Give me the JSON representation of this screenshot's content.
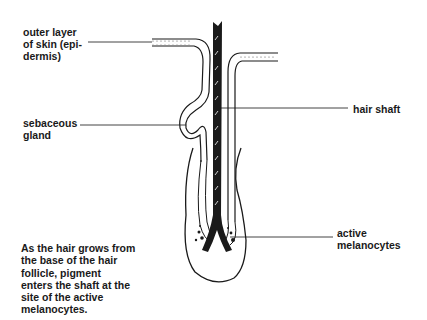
{
  "diagram": {
    "labels": {
      "epidermis": [
        "outer layer",
        "of skin (epi-",
        "dermis)"
      ],
      "sebaceous_gland": [
        "sebaceous",
        "gland"
      ],
      "hair_shaft": [
        "hair shaft"
      ],
      "active_melanocytes": [
        "active",
        "melanocytes"
      ]
    },
    "caption": [
      "As the hair grows from",
      "the base of the hair",
      "follicle, pigment",
      "enters the shaft at the",
      "site of the active",
      "melanocytes."
    ],
    "colors": {
      "ink": "#1a1a1a",
      "background": "#ffffff",
      "leader_line": "#444444"
    }
  }
}
